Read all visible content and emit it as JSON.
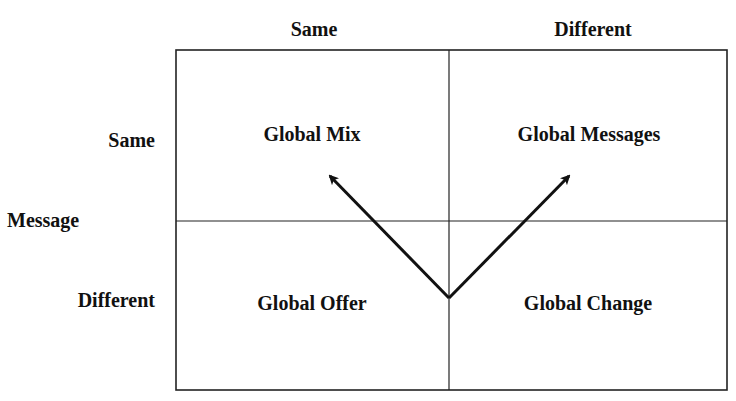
{
  "columns": {
    "header_same": "Same",
    "header_different": "Different"
  },
  "rows": {
    "axis_label": "Message",
    "header_same": "Same",
    "header_different": "Different"
  },
  "cells": {
    "top_left": "Global Mix",
    "top_right": "Global Messages",
    "bottom_left": "Global Offer",
    "bottom_right": "Global Change"
  },
  "arrows": [
    {
      "from": "Global Change / Global Offer boundary",
      "to": "Global Mix"
    },
    {
      "from": "Global Change / Global Offer boundary",
      "to": "Global Messages"
    }
  ],
  "colors": {
    "line": "#222222",
    "text": "#111111",
    "background": "#ffffff"
  }
}
